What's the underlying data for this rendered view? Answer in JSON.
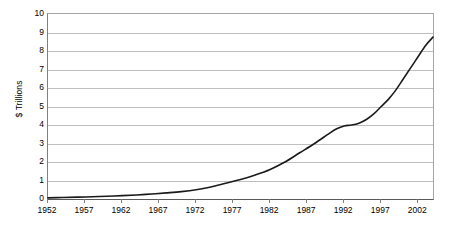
{
  "chart_data": {
    "type": "line",
    "title": "",
    "xlabel": "",
    "ylabel": "$ Trillions",
    "xlim": [
      1952,
      2004
    ],
    "ylim": [
      0,
      10
    ],
    "grid": true,
    "legend": "none",
    "y_ticks": [
      0,
      1,
      2,
      3,
      4,
      5,
      6,
      7,
      8,
      9,
      10
    ],
    "y_tick_labels": [
      "0",
      "1",
      "2",
      "3",
      "4",
      "5",
      "6",
      "7",
      "8",
      "9",
      "10"
    ],
    "x_ticks": [
      1952,
      1957,
      1962,
      1967,
      1972,
      1977,
      1982,
      1987,
      1992,
      1997,
      2002
    ],
    "x_tick_labels": [
      "1952",
      "1957",
      "1962",
      "1967",
      "1972",
      "1977",
      "1982",
      "1987",
      "1992",
      "1997",
      "2002"
    ],
    "series": [
      {
        "name": "Total",
        "color": "#1a1a1a",
        "x": [
          1952,
          1954,
          1956,
          1958,
          1960,
          1962,
          1964,
          1966,
          1968,
          1970,
          1972,
          1974,
          1976,
          1978,
          1980,
          1982,
          1984,
          1986,
          1988,
          1990,
          1991,
          1992,
          1993,
          1994,
          1995,
          1996,
          1997,
          1998,
          1999,
          2000,
          2001,
          2002,
          2003,
          2004
        ],
        "values": [
          0.06,
          0.08,
          0.1,
          0.12,
          0.15,
          0.18,
          0.22,
          0.27,
          0.33,
          0.4,
          0.5,
          0.65,
          0.85,
          1.05,
          1.3,
          1.6,
          2.0,
          2.5,
          3.0,
          3.55,
          3.8,
          3.95,
          4.0,
          4.1,
          4.3,
          4.6,
          5.0,
          5.4,
          5.9,
          6.5,
          7.1,
          7.7,
          8.3,
          8.75
        ]
      }
    ]
  },
  "axes": {
    "y_title": "$ Trillions"
  }
}
